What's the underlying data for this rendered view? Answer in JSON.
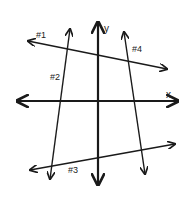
{
  "diagram": {
    "title": "",
    "colors": {
      "ink": "#1a1a1a",
      "background": "#ffffff"
    },
    "axes": {
      "x": {
        "label": "x",
        "from": [
          17,
          101
        ],
        "to": [
          178,
          101
        ],
        "both_arrows": true
      },
      "y": {
        "label": "y",
        "from": [
          98,
          185
        ],
        "to": [
          98,
          22
        ],
        "both_arrows": true
      }
    },
    "lines": [
      {
        "id": "1",
        "label": "#1",
        "from": [
          167,
          69
        ],
        "to": [
          28,
          41
        ],
        "label_pos": [
          36,
          38
        ]
      },
      {
        "id": "2",
        "label": "#2",
        "from": [
          50,
          179
        ],
        "to": [
          70,
          29
        ],
        "label_pos": [
          50,
          80
        ]
      },
      {
        "id": "3",
        "label": "#3",
        "from": [
          175,
          144
        ],
        "to": [
          30,
          170
        ],
        "label_pos": [
          68,
          173
        ]
      },
      {
        "id": "4",
        "label": "#4",
        "from": [
          145,
          174
        ],
        "to": [
          124,
          32
        ],
        "label_pos": [
          132,
          52
        ]
      }
    ],
    "axis_labels": {
      "x": {
        "text": "x",
        "pos": [
          166,
          98
        ]
      },
      "y": {
        "text": "y",
        "pos": [
          104,
          32
        ]
      }
    }
  }
}
